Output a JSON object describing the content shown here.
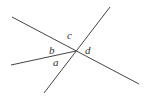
{
  "diagram": {
    "lines": [
      {
        "id": "line-1",
        "x1": 12,
        "y1": 17,
        "x2": 139,
        "y2": 84
      },
      {
        "id": "line-2",
        "x1": 110,
        "y1": 7,
        "x2": 44,
        "y2": 93
      },
      {
        "id": "ray-3",
        "x1": 11,
        "y1": 65,
        "x2": 76,
        "y2": 51
      }
    ],
    "intersection": {
      "x": 76,
      "y": 51
    },
    "labels": {
      "a": "a",
      "b": "b",
      "c": "c",
      "d": "d"
    }
  }
}
